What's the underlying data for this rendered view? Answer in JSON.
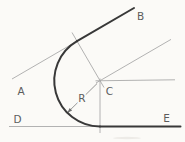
{
  "diagram": {
    "labels": {
      "line_a": "A",
      "line_b": "B",
      "center_c": "C",
      "line_d": "D",
      "line_e": "E",
      "radius_r": "R"
    },
    "colors": {
      "background": "#fbfaf7",
      "result_line": "#383838",
      "construction_line": "#a9a9a9",
      "leader_line": "#8a8a8a",
      "label_text": "#5c5c5c"
    }
  }
}
